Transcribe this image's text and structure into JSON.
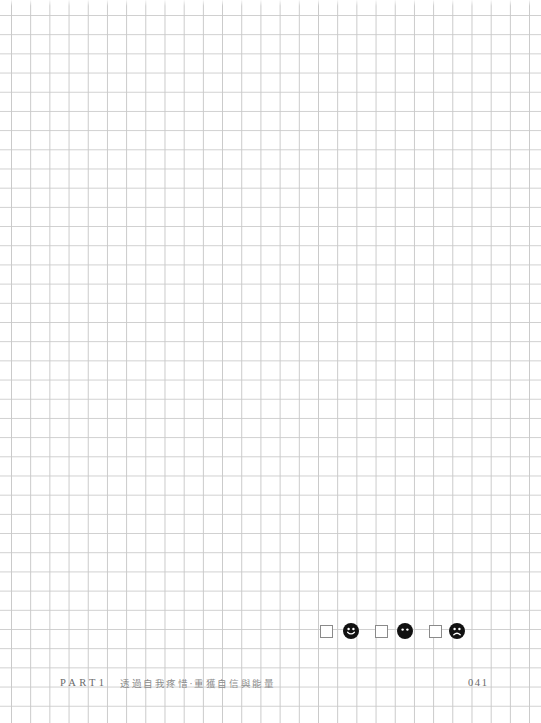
{
  "page": {
    "background": "grid-paper",
    "grid_color": "#cccccc",
    "grid_pitch_px": 19
  },
  "mood_tracker": {
    "items": [
      {
        "label": "happy",
        "icon": "happy-face-icon",
        "checked": false
      },
      {
        "label": "neutral",
        "icon": "neutral-face-icon",
        "checked": false
      },
      {
        "label": "sad",
        "icon": "sad-face-icon",
        "checked": false
      }
    ],
    "face_color": "#111111"
  },
  "footer": {
    "part_label": "PART1",
    "chapter_title": "透過自我疼惜‧重獲自信與能量",
    "page_number": "041"
  }
}
